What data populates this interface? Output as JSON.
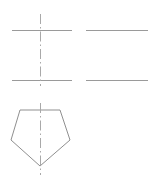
{
  "drawing": {
    "title": "Orthographic centerline construction with pentagon profile",
    "canvas": {
      "width": 153,
      "height": 181,
      "background": "#ffffff"
    },
    "colors": {
      "solid_line": "#9a9a9a",
      "center_line": "#a9a9a9",
      "shape_outline": "#8f8f8f",
      "background": "#ffffff"
    },
    "elements": {
      "top_left_horizontal": {
        "label": "Top left horizontal construction line",
        "x1": 12,
        "y1": 30.5,
        "x2": 72,
        "y2": 30.5
      },
      "top_right_horizontal": {
        "label": "Top right horizontal construction line",
        "x1": 86,
        "y1": 30.5,
        "x2": 148,
        "y2": 30.5
      },
      "bottom_left_horizontal": {
        "label": "Bottom left horizontal construction line",
        "x1": 12,
        "y1": 80.5,
        "x2": 72,
        "y2": 80.5
      },
      "bottom_right_horizontal": {
        "label": "Bottom right horizontal construction line",
        "x1": 86,
        "y1": 80.5,
        "x2": 148,
        "y2": 80.5
      },
      "upper_vertical_centerline": {
        "label": "Upper vertical dash-dot centerline",
        "x1": 40.5,
        "y1": 14,
        "x2": 40.5,
        "y2": 86
      },
      "pentagon_centerline": {
        "label": "Pentagon vertical dash-dot centerline",
        "x1": 40.5,
        "y1": 103,
        "x2": 40.5,
        "y2": 175
      },
      "pentagon": {
        "label": "Inverted pentagon profile",
        "points": "20,110 60,110 70,140 40,166 11,140",
        "vertices": [
          {
            "name": "top-left",
            "x": 20,
            "y": 110
          },
          {
            "name": "top-right",
            "x": 60,
            "y": 110
          },
          {
            "name": "right",
            "x": 70,
            "y": 140
          },
          {
            "name": "bottom-apex",
            "x": 40,
            "y": 166
          },
          {
            "name": "left",
            "x": 11,
            "y": 140
          }
        ]
      }
    }
  }
}
